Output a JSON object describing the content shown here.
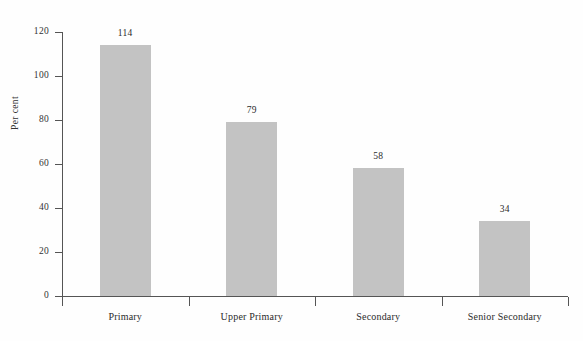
{
  "chart_data": {
    "type": "bar",
    "title": "",
    "subtitle": "",
    "xlabel": "",
    "ylabel": "Per cent",
    "categories": [
      "Primary",
      "Upper Primary",
      "Secondary",
      "Senior Secondary"
    ],
    "values": [
      114,
      79,
      58,
      34
    ],
    "value_labels": [
      "114",
      "79",
      "58",
      "34"
    ],
    "ylim": [
      0,
      120
    ],
    "ytick_labels": [
      "0",
      "20",
      "40",
      "60",
      "80",
      "100",
      "120"
    ],
    "ytick_values": [
      0,
      20,
      40,
      60,
      80,
      100,
      120
    ],
    "grid": false,
    "legend": null,
    "series": [
      {
        "name": "Gross Enrolment Ratio",
        "values": [
          114,
          79,
          58,
          34
        ]
      }
    ],
    "colors": {
      "bar_fill": "#c3c3c3",
      "axis": "#555555",
      "text": "#2b2b2b",
      "background": "#ffffff"
    }
  }
}
